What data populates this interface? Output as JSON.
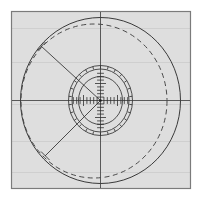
{
  "figure": {
    "type": "technical-line-drawing",
    "caption": "",
    "canvas": {
      "width": 203,
      "height": 201
    },
    "colors": {
      "page_background": "#ffffff",
      "plot_background": "#dcdcdc",
      "frame_stroke": "#8a8a8a",
      "line_stroke": "#3a3a3a",
      "dashed_stroke": "#4a4a4a",
      "tick_stroke": "#2e2e2e",
      "gear_stroke": "#333333"
    },
    "frame": {
      "label": "plot-frame",
      "x": 11,
      "y": 11,
      "width": 180,
      "height": 178,
      "stroke_width": 1.1
    },
    "center": {
      "x": 100.5,
      "y": 100.5
    },
    "axes": {
      "horizontal": {
        "x1": 12,
        "y1": 100.5,
        "x2": 190,
        "y2": 100.5
      },
      "vertical": {
        "x1": 100.5,
        "y1": 12,
        "x2": 100.5,
        "y2": 188
      },
      "stroke_width": 0.9
    },
    "outer_circle": {
      "label": "outer-solid-circle",
      "cx": 100.5,
      "cy": 100.5,
      "rx": 80,
      "ry": 83,
      "stroke_width": 1.0,
      "style": "solid"
    },
    "dashed_circle": {
      "label": "dashed-offset-circle",
      "cx": 94,
      "cy": 101,
      "rx": 73,
      "ry": 77,
      "stroke_width": 1.0,
      "style": "dashed",
      "dash_pattern": "5,3.5"
    },
    "inner_ring": {
      "label": "ratchet-ring",
      "cx": 100.5,
      "cy": 100.5,
      "outer_rx": 32,
      "outer_ry": 35,
      "mid_rx": 29,
      "mid_ry": 32,
      "inner_rx": 22,
      "inner_ry": 24,
      "tooth_count": 26,
      "stroke_width": 0.85
    },
    "radius_lines": [
      {
        "label": "radius-line-upper-left",
        "angle_deg": 208,
        "x1": 100.5,
        "y1": 100.5,
        "x2": 41,
        "y2": 46,
        "end_tick_length": 9,
        "stroke_width": 0.9
      },
      {
        "label": "radius-line-lower-left",
        "angle_deg": 138,
        "x1": 100.5,
        "y1": 100.5,
        "x2": 45,
        "y2": 156,
        "end_tick_length": 9,
        "stroke_width": 0.9
      }
    ],
    "axis_ticks": {
      "label": "center-scale-ticks",
      "horizontal_count": 17,
      "vertical_count": 17,
      "spacing_px": 3.4,
      "tick_half_length": 5.5,
      "stroke_width": 0.8
    }
  },
  "chart_data": {
    "type": "scatter",
    "xlabel": "",
    "ylabel": "",
    "grid": false,
    "legend": "none",
    "annotations": [
      "outer solid circle",
      "dashed offset circle",
      "26-tooth ratchet ring",
      "horizontal axis",
      "vertical axis",
      "two radius lines with end ticks",
      "fine tick scale along both axes"
    ]
  }
}
